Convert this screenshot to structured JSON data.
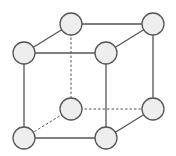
{
  "diagram": {
    "type": "cube-lattice",
    "colors": {
      "stroke": "#555555",
      "fill": "#eeeeee",
      "background": "#ffffff"
    },
    "nodes": [
      {
        "id": "back-top-left",
        "x": 71,
        "y": 24
      },
      {
        "id": "back-top-right",
        "x": 153,
        "y": 24
      },
      {
        "id": "front-top-left",
        "x": 24,
        "y": 53
      },
      {
        "id": "front-top-right",
        "x": 106,
        "y": 53
      },
      {
        "id": "back-bottom-left",
        "x": 71,
        "y": 109
      },
      {
        "id": "back-bottom-right",
        "x": 153,
        "y": 109
      },
      {
        "id": "front-bottom-left",
        "x": 24,
        "y": 138
      },
      {
        "id": "front-bottom-right",
        "x": 106,
        "y": 138
      }
    ],
    "edges": [
      {
        "from": "back-top-left",
        "to": "back-top-right",
        "style": "solid"
      },
      {
        "from": "front-top-left",
        "to": "front-top-right",
        "style": "solid"
      },
      {
        "from": "back-top-left",
        "to": "front-top-left",
        "style": "solid"
      },
      {
        "from": "back-top-right",
        "to": "front-top-right",
        "style": "solid"
      },
      {
        "from": "front-top-left",
        "to": "front-bottom-left",
        "style": "solid"
      },
      {
        "from": "front-top-right",
        "to": "front-bottom-right",
        "style": "solid"
      },
      {
        "from": "back-top-right",
        "to": "back-bottom-right",
        "style": "solid"
      },
      {
        "from": "front-bottom-left",
        "to": "front-bottom-right",
        "style": "solid"
      },
      {
        "from": "back-bottom-right",
        "to": "front-bottom-right",
        "style": "solid"
      },
      {
        "from": "back-top-left",
        "to": "back-bottom-left",
        "style": "dashed"
      },
      {
        "from": "back-bottom-left",
        "to": "back-bottom-right",
        "style": "dashed"
      },
      {
        "from": "back-bottom-left",
        "to": "front-bottom-left",
        "style": "dashed"
      }
    ],
    "node_radius": 11
  }
}
